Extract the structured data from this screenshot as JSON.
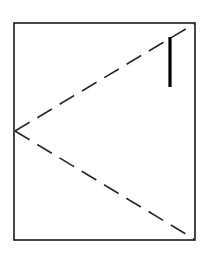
{
  "figure": {
    "canvas": {
      "width": 210,
      "height": 261,
      "background": "#ffffff"
    },
    "sheet": {
      "name": "paper-sheet-outline",
      "shape": "rectangle",
      "x": 14,
      "y": 23,
      "width": 181,
      "height": 217,
      "stroke_color": "#1a1a1a",
      "stroke_width": 1.6,
      "fill_color": "#ffffff"
    },
    "fold_lines": [
      {
        "name": "upper-fold-line",
        "style": "dashed",
        "from": {
          "x": 15,
          "y": 131
        },
        "to": {
          "x": 194,
          "y": 24
        },
        "stroke_color": "#2b2b2b",
        "stroke_width": 1.7,
        "dash_pattern": "17 9"
      },
      {
        "name": "lower-fold-line",
        "style": "dashed",
        "from": {
          "x": 15,
          "y": 131
        },
        "to": {
          "x": 194,
          "y": 239
        },
        "stroke_color": "#2b2b2b",
        "stroke_width": 1.7,
        "dash_pattern": "17 9"
      }
    ],
    "crease_mark": {
      "name": "vertical-crease-mark",
      "orientation": "vertical",
      "x": 170,
      "y_top": 37,
      "y_bottom": 87,
      "stroke_color": "#000000",
      "stroke_width": 3.2
    },
    "vertex": {
      "name": "fold-apex",
      "x": 15,
      "y": 131
    }
  }
}
